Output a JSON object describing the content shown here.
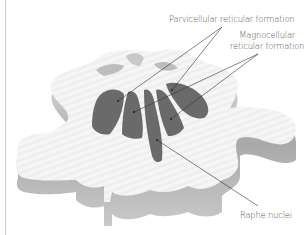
{
  "figure": {
    "colors": {
      "background": "#ffffff",
      "tissue_top": "#f4f4f4",
      "tissue_side": "#b5b5b5",
      "nuclei": "#6a6a6a",
      "leader_lines": "#333333",
      "label_text": "#555555"
    }
  },
  "labels": {
    "parvicellular": "Parvicellular reticular formation",
    "magnocellular_line1": "Magnocellular",
    "magnocellular_line2": "reticular formation",
    "raphe": "Raphe nuclei"
  }
}
